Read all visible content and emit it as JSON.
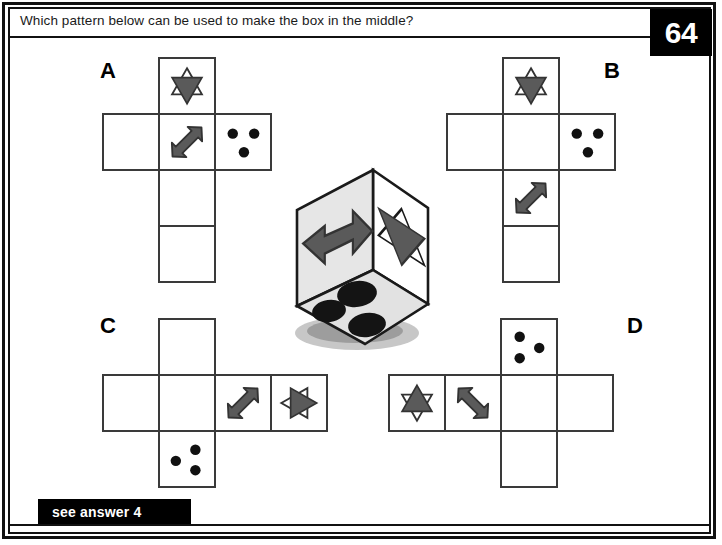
{
  "page": {
    "question": "Which pattern below can be used to make the box in the middle?",
    "page_number": "64",
    "answer_banner": "see answer 4"
  },
  "colors": {
    "frame": "#111111",
    "cell_stroke": "#3a3a3a",
    "glyph_fill": "#5a5a5a",
    "glyph_stroke": "#333333",
    "dot": "#111111",
    "badge_bg": "#000000",
    "badge_text": "#ffffff",
    "page_bg": "#ffffff",
    "box_face_light": "#e8e8e8",
    "box_face_mid": "#d8d8d8",
    "box_face_white": "#ffffff"
  },
  "puzzle": {
    "type": "cube-net-matching",
    "center_object": {
      "name": "die-cube",
      "faces": [
        {
          "position": "left",
          "symbol": "double-headed-arrow",
          "shade": "#e0e0e0"
        },
        {
          "position": "right",
          "symbol": "star-of-david",
          "shade": "#ffffff"
        },
        {
          "position": "top",
          "symbol": "three-dots",
          "shade": "#e8e8e8"
        }
      ]
    },
    "options": [
      {
        "id": "A",
        "label": "A",
        "label_x": 100,
        "label_y": 58,
        "origin_x": 102,
        "origin_y": 57,
        "cell": 58,
        "cells": [
          {
            "col": 1,
            "row": 0,
            "symbol": "star-of-david-up"
          },
          {
            "col": 0,
            "row": 1,
            "symbol": "empty"
          },
          {
            "col": 1,
            "row": 1,
            "symbol": "arrow-sw-ne"
          },
          {
            "col": 2,
            "row": 1,
            "symbol": "three-dots-a"
          },
          {
            "col": 1,
            "row": 2,
            "symbol": "empty"
          },
          {
            "col": 1,
            "row": 3,
            "symbol": "empty"
          }
        ]
      },
      {
        "id": "B",
        "label": "B",
        "label_x": 604,
        "label_y": 58,
        "origin_x": 446,
        "origin_y": 57,
        "cell": 58,
        "cells": [
          {
            "col": 1,
            "row": 0,
            "symbol": "star-of-david-up"
          },
          {
            "col": 0,
            "row": 1,
            "symbol": "empty"
          },
          {
            "col": 1,
            "row": 1,
            "symbol": "empty"
          },
          {
            "col": 2,
            "row": 1,
            "symbol": "three-dots-a"
          },
          {
            "col": 1,
            "row": 2,
            "symbol": "arrow-sw-ne"
          },
          {
            "col": 1,
            "row": 3,
            "symbol": "empty"
          }
        ]
      },
      {
        "id": "C",
        "label": "C",
        "label_x": 100,
        "label_y": 313,
        "origin_x": 102,
        "origin_y": 318,
        "cell": 58,
        "cells": [
          {
            "col": 1,
            "row": 0,
            "symbol": "empty"
          },
          {
            "col": 0,
            "row": 1,
            "symbol": "empty"
          },
          {
            "col": 1,
            "row": 1,
            "symbol": "empty"
          },
          {
            "col": 2,
            "row": 1,
            "symbol": "arrow-sw-ne"
          },
          {
            "col": 3,
            "row": 1,
            "symbol": "star-of-david-right"
          },
          {
            "col": 1,
            "row": 2,
            "symbol": "three-dots-c"
          }
        ]
      },
      {
        "id": "D",
        "label": "D",
        "label_x": 627,
        "label_y": 313,
        "origin_x": 388,
        "origin_y": 318,
        "cell": 58,
        "cells": [
          {
            "col": 2,
            "row": 0,
            "symbol": "three-dots-d"
          },
          {
            "col": 0,
            "row": 1,
            "symbol": "star-of-david-down"
          },
          {
            "col": 1,
            "row": 1,
            "symbol": "arrow-nw-se"
          },
          {
            "col": 2,
            "row": 1,
            "symbol": "empty"
          },
          {
            "col": 3,
            "row": 1,
            "symbol": "empty"
          },
          {
            "col": 2,
            "row": 2,
            "symbol": "empty"
          }
        ]
      }
    ]
  }
}
